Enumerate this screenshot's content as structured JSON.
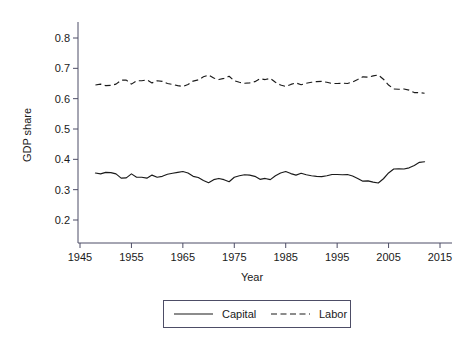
{
  "chart_data": {
    "type": "line",
    "title": "",
    "xlabel": "Year",
    "ylabel": "GDP share",
    "xlim": [
      1945,
      2015
    ],
    "ylim": [
      0.15,
      0.85
    ],
    "xticks": [
      1945,
      1955,
      1965,
      1975,
      1985,
      1995,
      2005,
      2015
    ],
    "xtick_labels": [
      "1945",
      "1955",
      "1965",
      "1975",
      "1985",
      "1995",
      "2005",
      "2015"
    ],
    "yticks": [
      0.2,
      0.3,
      0.4,
      0.5,
      0.6,
      0.7,
      0.8
    ],
    "ytick_labels": [
      "0.2",
      "0.3",
      "0.4",
      "0.5",
      "0.6",
      "0.7",
      "0.8"
    ],
    "grid": false,
    "legend_position": "below",
    "x": [
      1948,
      1949,
      1950,
      1951,
      1952,
      1953,
      1954,
      1955,
      1956,
      1957,
      1958,
      1959,
      1960,
      1961,
      1962,
      1963,
      1964,
      1965,
      1966,
      1967,
      1968,
      1969,
      1970,
      1971,
      1972,
      1973,
      1974,
      1975,
      1976,
      1977,
      1978,
      1979,
      1980,
      1981,
      1982,
      1983,
      1984,
      1985,
      1986,
      1987,
      1988,
      1989,
      1990,
      1991,
      1992,
      1993,
      1994,
      1995,
      1996,
      1997,
      1998,
      1999,
      2000,
      2001,
      2002,
      2003,
      2004,
      2005,
      2006,
      2007,
      2008,
      2009,
      2010,
      2011,
      2012
    ],
    "series": [
      {
        "name": "Capital",
        "style": "solid",
        "color": "#1a1a1a",
        "values": [
          0.355,
          0.352,
          0.357,
          0.356,
          0.352,
          0.338,
          0.339,
          0.352,
          0.341,
          0.341,
          0.338,
          0.348,
          0.341,
          0.344,
          0.351,
          0.354,
          0.357,
          0.36,
          0.355,
          0.344,
          0.34,
          0.33,
          0.323,
          0.333,
          0.337,
          0.333,
          0.326,
          0.341,
          0.346,
          0.349,
          0.348,
          0.344,
          0.334,
          0.337,
          0.333,
          0.346,
          0.355,
          0.36,
          0.353,
          0.348,
          0.354,
          0.349,
          0.346,
          0.344,
          0.343,
          0.346,
          0.35,
          0.35,
          0.349,
          0.35,
          0.345,
          0.337,
          0.328,
          0.329,
          0.325,
          0.322,
          0.336,
          0.355,
          0.368,
          0.369,
          0.368,
          0.372,
          0.38,
          0.39,
          0.392
        ]
      },
      {
        "name": "Labor",
        "style": "dashed",
        "color": "#1a1a1a",
        "values": [
          0.645,
          0.648,
          0.643,
          0.644,
          0.648,
          0.661,
          0.661,
          0.648,
          0.659,
          0.659,
          0.662,
          0.652,
          0.659,
          0.657,
          0.65,
          0.647,
          0.643,
          0.64,
          0.647,
          0.658,
          0.662,
          0.672,
          0.678,
          0.668,
          0.663,
          0.667,
          0.674,
          0.659,
          0.654,
          0.651,
          0.652,
          0.656,
          0.666,
          0.663,
          0.667,
          0.654,
          0.645,
          0.64,
          0.647,
          0.652,
          0.646,
          0.651,
          0.654,
          0.656,
          0.657,
          0.654,
          0.65,
          0.65,
          0.651,
          0.65,
          0.655,
          0.663,
          0.672,
          0.671,
          0.675,
          0.678,
          0.664,
          0.645,
          0.632,
          0.631,
          0.632,
          0.628,
          0.62,
          0.62,
          0.618
        ]
      }
    ],
    "legend": [
      {
        "label": "Capital",
        "style": "solid"
      },
      {
        "label": "Labor",
        "style": "dashed"
      }
    ]
  }
}
